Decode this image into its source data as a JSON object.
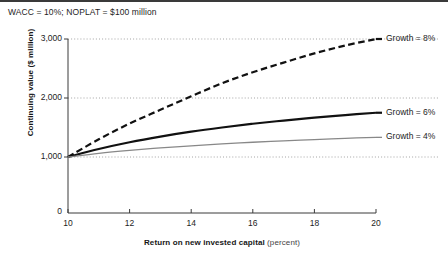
{
  "figure": {
    "caption": "WACC = 10%; NOPLAT = $100 million"
  },
  "chart_data": {
    "type": "line",
    "title": "",
    "subtitle": "WACC = 10%; NOPLAT = $100 million",
    "xlabel": "Return on new invested capital",
    "xunit": "(percent)",
    "ylabel": "Continuing value ($ million)",
    "xlim": [
      10,
      20
    ],
    "ylim": [
      0,
      3000
    ],
    "xticks": [
      10,
      12,
      14,
      16,
      18,
      20
    ],
    "xtick_labels": [
      "10",
      "12",
      "14",
      "16",
      "18",
      "20"
    ],
    "yticks": [
      1000,
      2000,
      3000
    ],
    "ytick_labels": [
      "1,000",
      "2,000",
      "3,000"
    ],
    "origin_label": "0",
    "grid": "horizontal-dotted",
    "legend_position": "right-inline",
    "series": [
      {
        "name": "Growth = 8%",
        "label": "Growth = 8%",
        "style": "dashed",
        "color": "#111111",
        "width": 2.2,
        "x": [
          10,
          11,
          12,
          13,
          14,
          15,
          16,
          17,
          18,
          19,
          20
        ],
        "values": [
          1000,
          1300,
          1567,
          1800,
          2029,
          2250,
          2437,
          2600,
          2756,
          2890,
          3000
        ]
      },
      {
        "name": "Growth = 6%",
        "label": "Growth = 6%",
        "style": "solid",
        "color": "#111111",
        "width": 2.2,
        "x": [
          10,
          11,
          12,
          13,
          14,
          15,
          16,
          17,
          18,
          19,
          20
        ],
        "values": [
          1000,
          1136,
          1250,
          1346,
          1429,
          1500,
          1563,
          1618,
          1667,
          1711,
          1750
        ]
      },
      {
        "name": "Growth = 4%",
        "label": "Growth = 4%",
        "style": "solid",
        "color": "#888888",
        "width": 1.3,
        "x": [
          10,
          11,
          12,
          13,
          14,
          15,
          16,
          17,
          18,
          19,
          20
        ],
        "values": [
          1000,
          1061,
          1111,
          1154,
          1190,
          1222,
          1250,
          1275,
          1296,
          1316,
          1333
        ]
      }
    ]
  }
}
